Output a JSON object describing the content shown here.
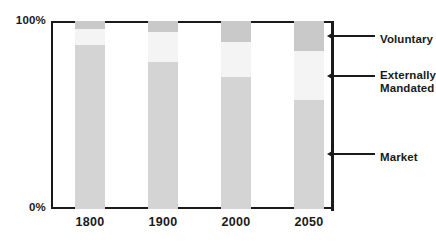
{
  "chart_data": {
    "type": "bar",
    "subtype": "stacked-percentage",
    "title": "",
    "subtitle": "",
    "xlabel": "",
    "ylabel": "",
    "categories": [
      "1800",
      "1900",
      "2000",
      "2050"
    ],
    "ylim": [
      0,
      100
    ],
    "ytick_labels": [
      "0%",
      "100%"
    ],
    "ytick_values": [
      0,
      100
    ],
    "grid": false,
    "legend_position": "right-callouts",
    "series": [
      {
        "name": "Market",
        "color": "#d4d4d4",
        "values": [
          87,
          78,
          70,
          58
        ]
      },
      {
        "name": "Externally Mandated",
        "color": "#f4f4f4",
        "values": [
          9,
          16,
          19,
          26
        ]
      },
      {
        "name": "Voluntary",
        "color": "#c9c9c9",
        "values": [
          4,
          6,
          11,
          16
        ]
      }
    ],
    "annotations": [
      {
        "label": "Voluntary",
        "target_series": "Voluntary",
        "target_category": "2050"
      },
      {
        "label": "Externally\nMandated",
        "target_series": "Externally Mandated",
        "target_category": "2050"
      },
      {
        "label": "Market",
        "target_series": "Market",
        "target_category": "2050"
      }
    ]
  },
  "axis": {
    "y_top_label": "100%",
    "y_bottom_label": "0%"
  },
  "xticks": [
    {
      "label": "1800"
    },
    {
      "label": "1900"
    },
    {
      "label": "2000"
    },
    {
      "label": "2050"
    }
  ],
  "callouts": [
    {
      "label": "Voluntary"
    },
    {
      "label": "Externally\nMandated"
    },
    {
      "label": "Market"
    }
  ],
  "colors": {
    "voluntary": "#c9c9c9",
    "externally_mandated": "#f4f4f4",
    "market": "#d4d4d4",
    "axis": "#1a1a1a",
    "background": "#ffffff"
  }
}
